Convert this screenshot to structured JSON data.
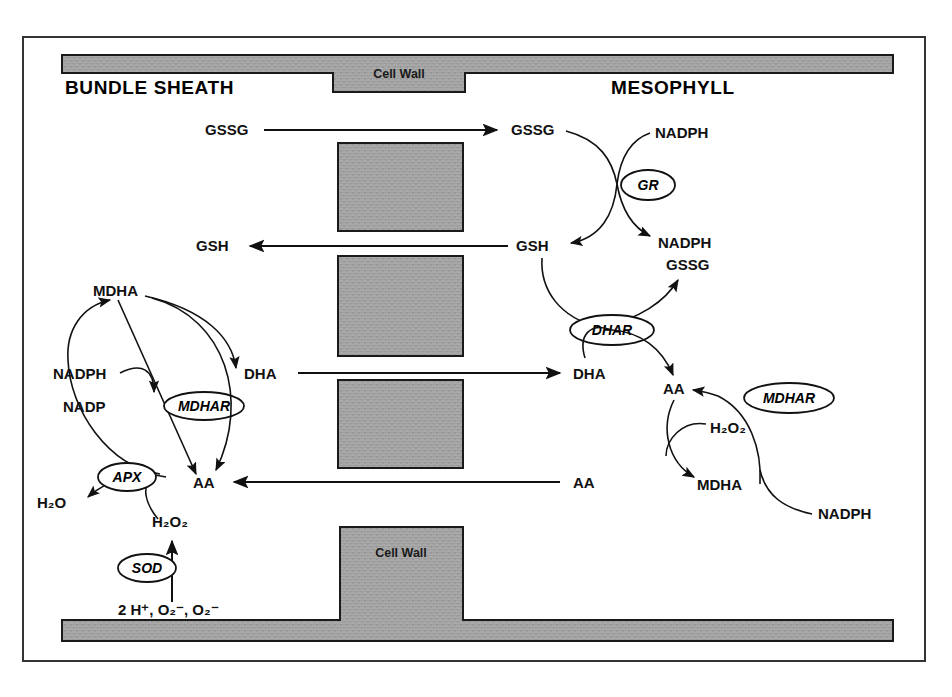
{
  "figure": {
    "regions": {
      "left_label": "BUNDLE SHEATH",
      "right_label": "MESOPHYLL"
    },
    "cell_wall_label_top": "Cell Wall",
    "cell_wall_label_bottom": "Cell Wall",
    "colors": {
      "wall_fill": "#a8a8a8",
      "ink": "#111111",
      "frame": "#333333",
      "background": "#ffffff"
    }
  },
  "metabolites": {
    "bs_gssg": "GSSG",
    "ms_gssg": "GSSG",
    "bs_gsh": "GSH",
    "ms_gsh": "GSH",
    "bs_dha": "DHA",
    "ms_dha": "DHA",
    "bs_aa": "AA",
    "ms_aa_lower": "AA",
    "ms_aa_upper": "AA",
    "bs_mdha": "MDHA",
    "ms_mdha": "MDHA",
    "bs_nadph": "NADPH",
    "bs_nadp": "NADP",
    "ms_nadph_gr_in": "NADPH",
    "ms_nadph_gr_out": "NADPH",
    "ms_gssg_out": "GSSG",
    "ms_nadph_mdhar": "NADPH",
    "bs_h2o": "H₂O",
    "bs_h2o2": "H₂O₂",
    "ms_h2o2": "H₂O₂",
    "bs_substrate": "2 H⁺, O₂⁻, O₂⁻"
  },
  "enzymes": {
    "gr": "GR",
    "dhar": "DHAR",
    "mdhar_mesophyll": "MDHAR",
    "mdhar_bundle": "MDHAR",
    "apx": "APX",
    "sod": "SOD"
  },
  "transport_arrows": [
    {
      "name": "gssg-transport",
      "label": "GSSG",
      "direction": "right"
    },
    {
      "name": "gsh-transport",
      "label": "GSH",
      "direction": "left"
    },
    {
      "name": "dha-transport",
      "label": "DHA",
      "direction": "right"
    },
    {
      "name": "aa-transport",
      "label": "AA",
      "direction": "left"
    }
  ]
}
